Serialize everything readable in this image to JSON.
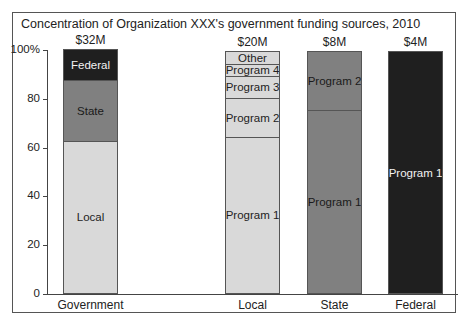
{
  "chart_data": {
    "type": "bar",
    "stacked": true,
    "title": "Concentration of Organization XXX's government funding sources, 2010",
    "xlabel": "",
    "ylabel": "",
    "ylim": [
      0,
      100
    ],
    "y_ticks": [
      "0",
      "20",
      "40",
      "60",
      "80",
      "100%"
    ],
    "grid": false,
    "legend": "none (segments labeled inline)",
    "categories": [
      "Government",
      "Local",
      "State",
      "Federal"
    ],
    "totals": [
      "$32M",
      "$20M",
      "$8M",
      "$4M"
    ],
    "bars": [
      {
        "category": "Government",
        "total": "$32M",
        "segments": [
          {
            "label": "Local",
            "value": 62.5,
            "color": "#d9d9d9",
            "text_color": "#222222"
          },
          {
            "label": "State",
            "value": 25,
            "color": "#808080",
            "text_color": "#1a1a1a"
          },
          {
            "label": "Federal",
            "value": 12.5,
            "color": "#1f1f1f",
            "text_color": "#f2f2f2"
          }
        ]
      },
      {
        "category": "Local",
        "total": "$20M",
        "segments": [
          {
            "label": "Program 1",
            "value": 64,
            "color": "#d9d9d9",
            "text_color": "#222222"
          },
          {
            "label": "Program 2",
            "value": 16,
            "color": "#d9d9d9",
            "text_color": "#222222"
          },
          {
            "label": "Program 3",
            "value": 9,
            "color": "#d9d9d9",
            "text_color": "#222222"
          },
          {
            "label": "Program 4",
            "value": 5,
            "color": "#d9d9d9",
            "text_color": "#222222"
          },
          {
            "label": "Other",
            "value": 5,
            "color": "#d9d9d9",
            "text_color": "#222222"
          }
        ]
      },
      {
        "category": "State",
        "total": "$8M",
        "segments": [
          {
            "label": "Program 1",
            "value": 75,
            "color": "#808080",
            "text_color": "#1a1a1a"
          },
          {
            "label": "Program 2",
            "value": 24,
            "color": "#808080",
            "text_color": "#1a1a1a"
          }
        ]
      },
      {
        "category": "Federal",
        "total": "$4M",
        "segments": [
          {
            "label": "Program 1",
            "value": 99,
            "color": "#1f1f1f",
            "text_color": "#f2f2f2"
          }
        ]
      }
    ]
  }
}
